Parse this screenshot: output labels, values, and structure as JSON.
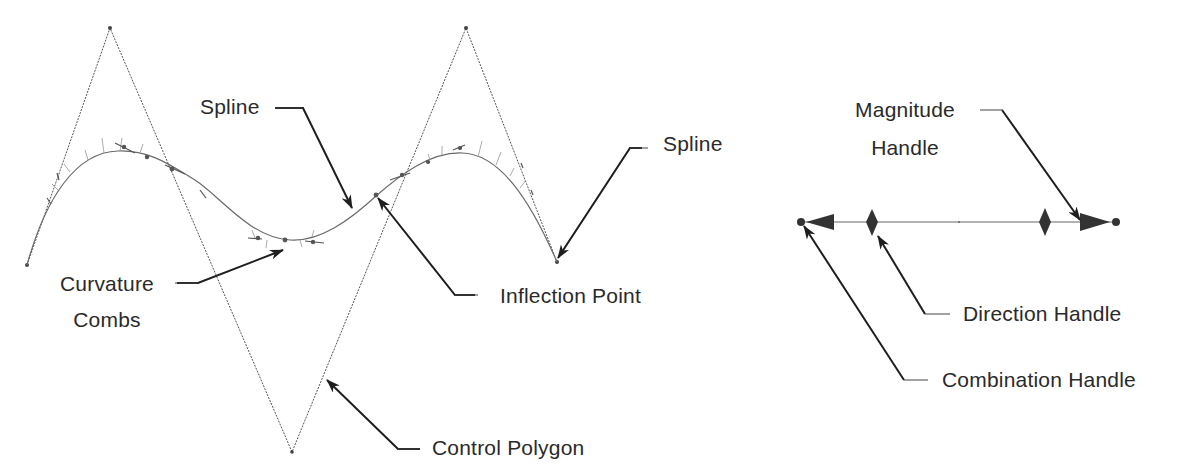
{
  "labels": {
    "spline_middle": "Spline",
    "spline_end": "Spline",
    "inflection_point": "Inflection Point",
    "curvature_combs_line1": "Curvature",
    "curvature_combs_line2": "Combs",
    "control_polygon": "Control Polygon",
    "magnitude_handle_line1": "Magnitude",
    "magnitude_handle_line2": "Handle",
    "direction_handle": "Direction Handle",
    "combination_handle": "Combination Handle"
  },
  "colors": {
    "ink": "#2a2a2a",
    "curve": "#6a6a6a",
    "polygon": "#555555",
    "comb": "#9a9a9a",
    "background": "#ffffff"
  },
  "icons": {
    "handle_arrow_left": "filled-triangle-left",
    "handle_arrow_right": "filled-triangle-right",
    "direction_diamond": "filled-diamond",
    "endpoint_dot": "filled-circle"
  }
}
